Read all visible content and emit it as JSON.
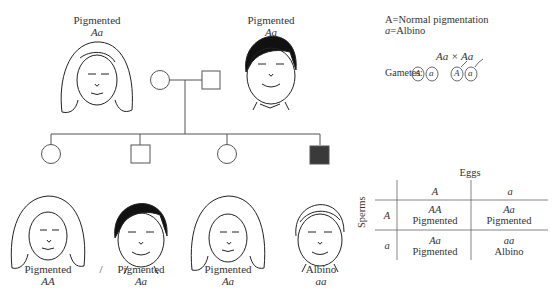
{
  "parents": [
    {
      "phenotype": "Pigmented",
      "genotype": "Aa",
      "sex": "female"
    },
    {
      "phenotype": "Pigmented",
      "genotype": "Aa",
      "sex": "male"
    }
  ],
  "children": [
    {
      "phenotype": "Pigmented",
      "genotype": "AA",
      "sex": "female",
      "affected": false
    },
    {
      "phenotype": "Pigmented",
      "genotype": "Aa",
      "sex": "male",
      "affected": false
    },
    {
      "phenotype": "Pigmented",
      "genotype": "Aa",
      "sex": "female",
      "affected": false
    },
    {
      "phenotype": "Albino",
      "genotype": "aa",
      "sex": "male",
      "affected": true
    }
  ],
  "separator": "/",
  "legend": {
    "line1_symbol": "A",
    "line1_text": "=Normal pigmentation",
    "line2_symbol": "a",
    "line2_text": "=Albino"
  },
  "cross": "Aa × Aa",
  "gametes": {
    "label": "Gametes:",
    "eggs": [
      "A",
      "a"
    ],
    "sperm": [
      "A",
      "a"
    ]
  },
  "punnett": {
    "top_label": "Eggs",
    "side_label": "Sperms",
    "cols": [
      "A",
      "a"
    ],
    "rows": [
      "A",
      "a"
    ],
    "cells": [
      [
        {
          "g": "AA",
          "p": "Pigmented"
        },
        {
          "g": "Aa",
          "p": "Pigmented"
        }
      ],
      [
        {
          "g": "Aa",
          "p": "Pigmented"
        },
        {
          "g": "aa",
          "p": "Albino"
        }
      ]
    ]
  },
  "colors": {
    "affected": "#3a3a3a",
    "line": "#555555"
  }
}
